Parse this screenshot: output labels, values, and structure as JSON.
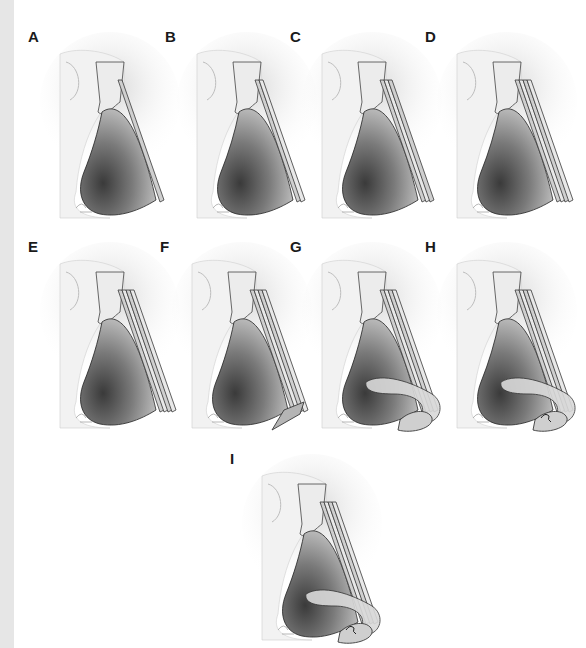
{
  "figure": {
    "background": "#ffffff",
    "left_strip_color": "#e6e6e6",
    "panels": [
      {
        "label": "A",
        "x": 28,
        "y": 28,
        "layers": 1,
        "tip": "none"
      },
      {
        "label": "B",
        "x": 165,
        "y": 28,
        "layers": 2,
        "tip": "none"
      },
      {
        "label": "C",
        "x": 290,
        "y": 28,
        "layers": 3,
        "tip": "none"
      },
      {
        "label": "D",
        "x": 425,
        "y": 28,
        "layers": 4,
        "tip": "none"
      },
      {
        "label": "E",
        "x": 28,
        "y": 238,
        "layers": 4,
        "tip": "none"
      },
      {
        "label": "F",
        "x": 160,
        "y": 238,
        "layers": 4,
        "tip": "triangle"
      },
      {
        "label": "G",
        "x": 290,
        "y": 238,
        "layers": 4,
        "tip": "curved"
      },
      {
        "label": "H",
        "x": 425,
        "y": 238,
        "layers": 4,
        "tip": "curved-hook"
      },
      {
        "label": "I",
        "x": 230,
        "y": 450,
        "layers": 4,
        "tip": "curved-hook"
      }
    ],
    "colors": {
      "skin": "#f2f2f2",
      "skin_shadow": "#d8d8d8",
      "cartilage_dark": "#555555",
      "cartilage_mid": "#8a8a8a",
      "graft_fill": "#d9d9d9",
      "graft_stroke": "#3a3a3a",
      "label": "#1a1a1a"
    },
    "caption": "(caption text clipped at bottom edge — not legible)"
  }
}
